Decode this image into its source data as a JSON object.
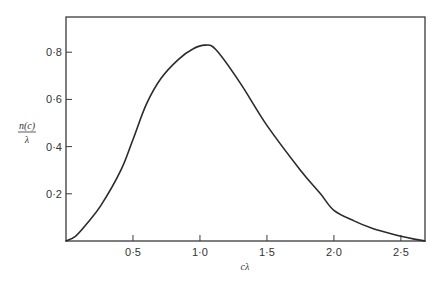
{
  "chart_data": {
    "type": "line",
    "title": "",
    "xlabel": "cλ",
    "ylabel_numerator": "n(c)",
    "ylabel_denominator": "λ",
    "xlim": [
      0,
      2.68
    ],
    "ylim": [
      0,
      0.95
    ],
    "grid": false,
    "legend": null,
    "x_ticks": [
      0.5,
      1.0,
      1.5,
      2.0,
      2.5
    ],
    "x_tick_labels": [
      "0·5",
      "1·0",
      "1·5",
      "2·0",
      "2·5"
    ],
    "y_ticks": [
      0.2,
      0.4,
      0.6,
      0.8
    ],
    "y_tick_labels": [
      "0·2",
      "0·4",
      "0·6",
      "0·8"
    ],
    "series": [
      {
        "name": "n(c)/λ",
        "x": [
          0.0,
          0.07,
          0.15,
          0.26,
          0.41,
          0.5,
          0.6,
          0.71,
          0.84,
          0.95,
          1.04,
          1.12,
          1.3,
          1.5,
          1.75,
          1.9,
          2.0,
          2.15,
          2.28,
          2.4,
          2.5,
          2.6,
          2.68
        ],
        "values": [
          0.0,
          0.02,
          0.07,
          0.15,
          0.3,
          0.43,
          0.58,
          0.69,
          0.77,
          0.815,
          0.83,
          0.81,
          0.67,
          0.49,
          0.3,
          0.2,
          0.13,
          0.085,
          0.055,
          0.035,
          0.02,
          0.008,
          0.0
        ]
      }
    ]
  }
}
